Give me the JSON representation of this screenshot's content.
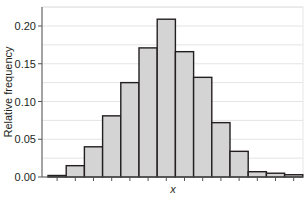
{
  "chart_data": {
    "type": "bar",
    "subtype": "histogram",
    "title": "",
    "xlabel": "x",
    "ylabel": "Relative frequency",
    "ylim": [
      0,
      0.225
    ],
    "yticks": [
      0.0,
      0.05,
      0.1,
      0.15,
      0.2
    ],
    "ytick_labels": [
      "0.00",
      "0.05",
      "0.10",
      "0.15",
      "0.20"
    ],
    "grid": true,
    "legend": null,
    "bar_color": "#d4d4d4",
    "bar_edge_color": "#231f20",
    "categories": [
      "1",
      "2",
      "3",
      "4",
      "5",
      "6",
      "7",
      "8",
      "9",
      "10",
      "11",
      "12",
      "13",
      "14"
    ],
    "values": [
      0.002,
      0.015,
      0.04,
      0.081,
      0.125,
      0.171,
      0.209,
      0.166,
      0.132,
      0.072,
      0.034,
      0.007,
      0.005,
      0.003
    ]
  }
}
